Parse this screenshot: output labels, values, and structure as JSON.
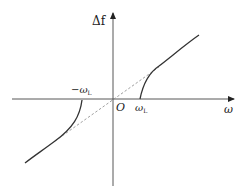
{
  "diagram": {
    "type": "function-sketch",
    "axes": {
      "y_label": "Δf",
      "x_label": "ω",
      "origin_label": "O"
    },
    "marks": {
      "neg_threshold": "−ω",
      "neg_threshold_sub": "L",
      "pos_threshold": "ω",
      "pos_threshold_sub": "L"
    },
    "curves": [
      {
        "name": "right-branch",
        "style": "solid",
        "from": "ω_L on x-axis",
        "to": "upper right"
      },
      {
        "name": "left-branch",
        "style": "solid",
        "from": "−ω_L on x-axis",
        "to": "lower left"
      },
      {
        "name": "asymptote",
        "style": "dashed",
        "passes_through": "origin"
      }
    ],
    "colors": {
      "axis": "#333333",
      "curve": "#333333",
      "dashed": "#888888"
    }
  }
}
